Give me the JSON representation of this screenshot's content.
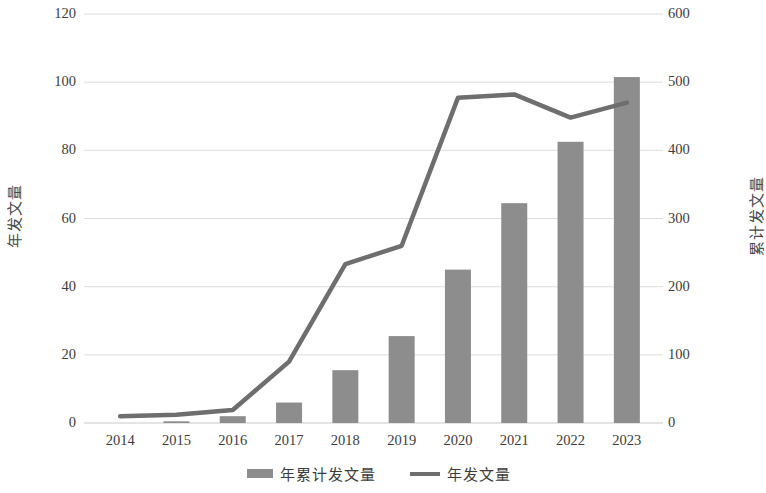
{
  "chart_data": {
    "type": "bar",
    "title": "",
    "subtitle": "",
    "categories": [
      "2014",
      "2015",
      "2016",
      "2017",
      "2018",
      "2019",
      "2020",
      "2021",
      "2022",
      "2023"
    ],
    "xlabel": "",
    "grid": true,
    "legend_position": "bottom",
    "series": [
      {
        "name": "年累计发文量",
        "type": "bar",
        "axis": "left",
        "color": "#8d8d8d",
        "values": [
          0,
          0.5,
          2,
          6,
          15.5,
          25.5,
          45,
          64.5,
          82.5,
          101.5
        ]
      },
      {
        "name": "年发文量",
        "type": "line",
        "axis": "right",
        "color": "#6e6e6e",
        "values": [
          10,
          12,
          19,
          90,
          233,
          260,
          477,
          482,
          448,
          470
        ]
      }
    ],
    "left_axis": {
      "label": "年发文量",
      "ticks": [
        0,
        20,
        40,
        60,
        80,
        100,
        120
      ],
      "ylim": [
        0,
        120
      ]
    },
    "right_axis": {
      "label": "累计发文量",
      "ticks": [
        0,
        100,
        200,
        300,
        400,
        500,
        600
      ],
      "ylim": [
        0,
        600
      ]
    }
  },
  "legend": {
    "items": [
      {
        "label": "年累计发文量",
        "marker": "bar-swatch"
      },
      {
        "label": "年发文量",
        "marker": "line-swatch"
      }
    ]
  }
}
